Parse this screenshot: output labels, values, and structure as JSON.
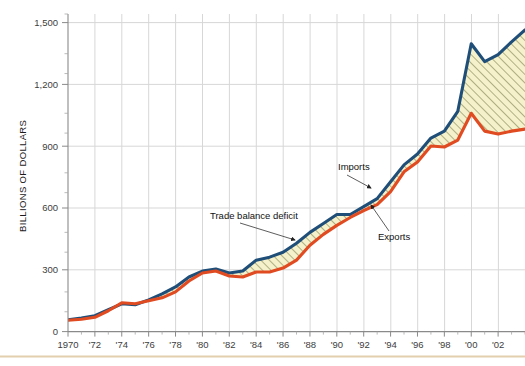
{
  "chart_data": {
    "type": "area",
    "title": "",
    "subtitle": "",
    "xlabel": "",
    "ylabel": "BILLIONS OF DOLLARS",
    "xlim": [
      1970,
      2004
    ],
    "ylim": [
      0,
      1600
    ],
    "y_ticks": [
      0,
      300,
      600,
      900,
      1200,
      1500
    ],
    "y_tick_labels": [
      "0",
      "300",
      "600",
      "900",
      "1,200",
      "1,500"
    ],
    "x_ticks": [
      1970,
      1972,
      1974,
      1976,
      1978,
      1980,
      1982,
      1984,
      1986,
      1988,
      1990,
      1992,
      1994,
      1996,
      1998,
      2000,
      2002
    ],
    "x_tick_labels": [
      "1970",
      "'72",
      "'74",
      "'76",
      "'78",
      "'80",
      "'82",
      "'84",
      "'86",
      "'88",
      "'90",
      "'92",
      "'94",
      "'96",
      "'98",
      "'00",
      "'02"
    ],
    "x_minor_interval": 1,
    "y_minor_interval": 100,
    "grid": true,
    "legend_position": "inline-annotations",
    "x": [
      1970,
      1971,
      1972,
      1973,
      1974,
      1975,
      1976,
      1977,
      1978,
      1979,
      1980,
      1981,
      1982,
      1983,
      1984,
      1985,
      1986,
      1987,
      1988,
      1989,
      1990,
      1991,
      1992,
      1993,
      1994,
      1995,
      1996,
      1997,
      1998,
      1999,
      2000,
      2001,
      2002,
      2003,
      2004
    ],
    "series": [
      {
        "name": "Imports",
        "color": "#1f4e79",
        "values": [
          60,
          68,
          80,
          110,
          140,
          135,
          160,
          190,
          225,
          275,
          305,
          315,
          295,
          305,
          360,
          375,
          400,
          445,
          500,
          545,
          590,
          590,
          630,
          670,
          755,
          840,
          895,
          975,
          1010,
          1110,
          1450,
          1360,
          1395,
          1460,
          1520
        ]
      },
      {
        "name": "Exports",
        "color": "#e04b22",
        "values": [
          57,
          62,
          72,
          105,
          145,
          140,
          155,
          170,
          200,
          255,
          295,
          305,
          280,
          275,
          300,
          300,
          320,
          360,
          435,
          490,
          535,
          575,
          610,
          640,
          705,
          805,
          855,
          935,
          930,
          965,
          1100,
          1010,
          995,
          1010,
          1020
        ]
      }
    ],
    "band": {
      "name": "Trade balance deficit",
      "fill": "#f2efc8",
      "hatch": "diagonal",
      "hatch_color": "#8a8a5a"
    },
    "annotations": [
      {
        "text": "Imports",
        "x": 338,
        "y": 170,
        "arrow_to_x": 372,
        "arrow_to_y": 189
      },
      {
        "text": "Exports",
        "x": 378,
        "y": 240,
        "arrow_to_x": 370,
        "arrow_to_y": 204
      },
      {
        "text": "Trade balance deficit",
        "x": 210,
        "y": 219,
        "arrow_to_x": 296,
        "arrow_to_y": 241
      }
    ]
  },
  "figure": {
    "background_color": "#ffffff",
    "grid_color": "#d7d7d7",
    "axis_color": "#8a8a8a",
    "footer_rule_color": "#e3cfae"
  }
}
